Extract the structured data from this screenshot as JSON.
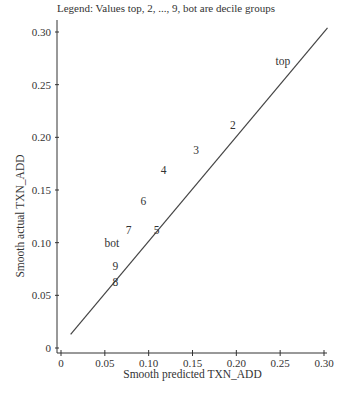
{
  "chart_data": {
    "type": "scatter",
    "title": "Legend: Values top, 2, ..., 9, bot are decile groups",
    "xlabel": "Smooth predicted TXN_ADD",
    "ylabel": "Smooth actual TXN_ADD",
    "xlim": [
      0,
      0.3
    ],
    "ylim": [
      0,
      0.3
    ],
    "x_ticks": [
      "0",
      "0.05",
      "0.10",
      "0.15",
      "0.20",
      "0.25",
      "0.30"
    ],
    "y_ticks": [
      "0",
      "0.05",
      "0.10",
      "0.15",
      "0.20",
      "0.25",
      "0.30"
    ],
    "grid": false,
    "legend_position": "top",
    "reference_line": {
      "label": "y = x",
      "x": [
        0.011,
        0.304
      ],
      "y": [
        0.013,
        0.304
      ]
    },
    "points": [
      {
        "label": "top",
        "x": 0.253,
        "y": 0.272
      },
      {
        "label": "2",
        "x": 0.196,
        "y": 0.212
      },
      {
        "label": "3",
        "x": 0.154,
        "y": 0.188
      },
      {
        "label": "4",
        "x": 0.117,
        "y": 0.169
      },
      {
        "label": "5",
        "x": 0.109,
        "y": 0.112
      },
      {
        "label": "6",
        "x": 0.094,
        "y": 0.14
      },
      {
        "label": "7",
        "x": 0.077,
        "y": 0.112
      },
      {
        "label": "8",
        "x": 0.062,
        "y": 0.063
      },
      {
        "label": "9",
        "x": 0.062,
        "y": 0.078
      },
      {
        "label": "bot",
        "x": 0.058,
        "y": 0.1
      }
    ]
  },
  "axis_geometry": {
    "x0_px": 61,
    "x1_px": 324,
    "y0_px": 348,
    "y1_px": 32,
    "axis_x_px": 57,
    "axis_y_px": 353
  },
  "colors": {
    "line": "#444444",
    "axis": "#333333",
    "text": "#333333"
  }
}
